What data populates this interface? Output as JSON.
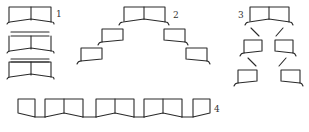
{
  "figure": {
    "line_color": "#2a2a2a",
    "background": "#ffffff"
  },
  "labels": [
    {
      "id": "1",
      "text": "1",
      "x": 56,
      "y": 17
    },
    {
      "id": "2",
      "text": "2",
      "x": 173,
      "y": 18
    },
    {
      "id": "3",
      "text": "3",
      "x": 238,
      "y": 18
    },
    {
      "id": "4",
      "text": "4",
      "x": 214,
      "y": 112
    }
  ],
  "groups": [
    {
      "id": "1",
      "name": "stacked-double-units",
      "paths": [
        "M9,22 L9,7 L51,7 L51,22",
        "M31,7 L31,20",
        "M7,24 Q8,22 10,22 L31,19 L52,22 Q54,22 54,24",
        "M11,32 L49,32",
        "M11,36 L49,36",
        "M9,51 L9,36",
        "M51,51 L51,36",
        "M31,36 L31,49",
        "M7,53 Q8,51 10,51 L31,48 L52,51 Q54,51 54,53",
        "M11,59 L49,59",
        "M9,77 L9,62 L51,62 L51,77",
        "M11,62 L49,62",
        "M31,62 L31,75",
        "M7,79 Q8,77 10,77 L31,74 L52,77 Q54,77 54,79"
      ]
    },
    {
      "id": "2",
      "name": "pyramid-spread",
      "paths": [
        "M124,21 L124,7 L165,7 L165,22",
        "M144,7 L144,19",
        "M119,25 Q120,22 123,22 L144,19 L166,22 Q168,22 169,25",
        "M102,42 L102,29 L123,29 L123,40 L102,42",
        "M98,45 Q99,42 102,42",
        "M81,61 L81,48 L102,48 L102,59 L81,61",
        "M77,64 Q78,61 81,61",
        "M164,40 L164,29 L185,29 L185,42 L164,40",
        "M185,42 Q187,42 188,45",
        "M186,59 L186,48 L207,48 L207,61 L186,59",
        "M207,61 Q209,61 210,64"
      ]
    },
    {
      "id": "3",
      "name": "tree-branch",
      "paths": [
        "M250,21 L250,7 L289,7 L289,22",
        "M269,7 L269,19",
        "M245,25 Q246,22 249,22 L269,19 L290,22 Q292,22 293,25",
        "M251,28 L259,36",
        "M283,28 L276,36",
        "M244,53 L244,40 L262,40 L262,51 L244,53",
        "M240,56 Q241,53 244,53",
        "M275,51 L275,40 L293,40 L293,53 L275,51",
        "M293,53 Q295,53 296,56",
        "M248,58 L256,66",
        "M286,58 L279,66",
        "M238,83 L238,70 L257,70 L257,81 L238,83",
        "M234,86 Q235,83 238,83",
        "M281,81 L281,70 L300,70 L300,83 L281,81",
        "M300,83 Q302,83 303,86"
      ]
    },
    {
      "id": "4",
      "name": "linear-chain",
      "paths": [
        "M18,99 L18,113 L35,117 L35,99 L18,99",
        "M35,117 L45,117",
        "M45,117 L45,99 L83,99 L83,117",
        "M64,99 L64,113",
        "M45,117 L64,113 L83,117",
        "M83,117 L96,117",
        "M96,117 L96,99 L134,99 L134,117",
        "M115,99 L115,113",
        "M96,117 L115,113 L134,117",
        "M134,117 L144,117",
        "M144,117 L144,99 L182,99 L182,117",
        "M163,99 L163,113",
        "M144,117 L163,113 L182,117",
        "M182,117 L193,117",
        "M193,117 L193,99 L210,99 L210,113 L193,117"
      ]
    }
  ]
}
